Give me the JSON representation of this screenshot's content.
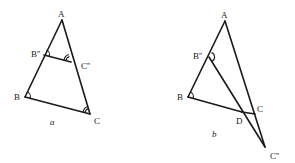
{
  "figures": [
    {
      "id": "a",
      "caption": "a",
      "points": {
        "A": {
          "label": "A",
          "x": 62,
          "y": 20
        },
        "B2": {
          "label": "B''",
          "x": 44,
          "y": 55
        },
        "C2": {
          "label": "C''",
          "x": 71,
          "y": 62
        },
        "B": {
          "label": "B",
          "x": 25,
          "y": 97
        },
        "C": {
          "label": "C",
          "x": 90,
          "y": 114
        }
      },
      "segments": [
        [
          "A",
          "B"
        ],
        [
          "A",
          "C"
        ],
        [
          "B",
          "C"
        ],
        [
          "B2",
          "C2"
        ]
      ]
    },
    {
      "id": "b",
      "caption": "b",
      "points": {
        "A": {
          "label": "A",
          "x": 225,
          "y": 21
        },
        "B2": {
          "label": "B''",
          "x": 209,
          "y": 57
        },
        "B": {
          "label": "B",
          "x": 188,
          "y": 97
        },
        "C": {
          "label": "C",
          "x": 255,
          "y": 114
        },
        "D": {
          "label": "D",
          "x": 242,
          "y": 112
        },
        "C2": {
          "label": "C''",
          "x": 265,
          "y": 147
        }
      },
      "segments": [
        [
          "A",
          "B"
        ],
        [
          "A",
          "C2"
        ],
        [
          "B",
          "C"
        ],
        [
          "B2",
          "C2"
        ]
      ]
    }
  ],
  "labels": {
    "a_A": "A",
    "a_B2": "B''",
    "a_C2": "C''",
    "a_B": "B",
    "a_C": "C",
    "a_caption": "a",
    "b_A": "A",
    "b_B2": "B''",
    "b_B": "B",
    "b_C": "C",
    "b_D": "D",
    "b_C2": "C''",
    "b_caption": "b"
  }
}
